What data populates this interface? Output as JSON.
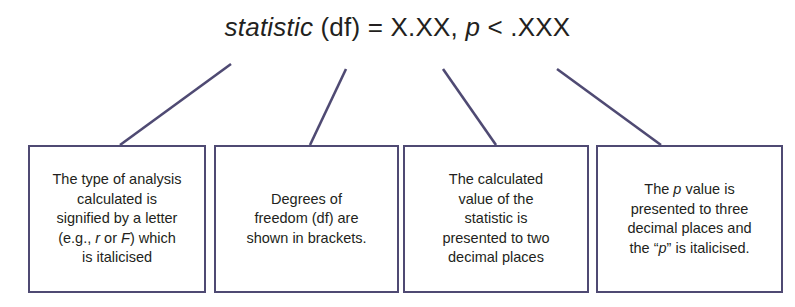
{
  "figure": {
    "kind": "annotated-formula-diagram",
    "border_color": "#4f4a73",
    "line_color": "#4f4a73",
    "text_color": "#231f20",
    "background": "#ffffff"
  },
  "formula": {
    "statistic": "statistic",
    "df": " (df) = ",
    "value": "X.XX, ",
    "p": "p",
    "pvalue": " < .XXX"
  },
  "boxes": [
    {
      "id": "box-1",
      "name": "statistic-letter-explanation",
      "line1": "The type of analysis",
      "line2": "calculated is",
      "line3": "signified by a letter",
      "line4_pre": "(e.g., ",
      "line4_r": "r",
      "line4_mid": " or ",
      "line4_f": "F",
      "line4_post": ") which",
      "line5": "is italicised"
    },
    {
      "id": "box-2",
      "name": "degrees-of-freedom-explanation",
      "line1": "Degrees of",
      "line2": "freedom (df) are",
      "line3": "shown in brackets."
    },
    {
      "id": "box-3",
      "name": "calculated-value-explanation",
      "line1": "The calculated",
      "line2": "value of the",
      "line3": "statistic is",
      "line4": "presented to two",
      "line5": "decimal places"
    },
    {
      "id": "box-4",
      "name": "p-value-explanation",
      "line1_pre": "The ",
      "line1_p": "p",
      "line1_post": " value is",
      "line2": "presented to three",
      "line3": "decimal places and",
      "line4_pre": "the “",
      "line4_p": "p",
      "line4_post": "” is italicised."
    }
  ],
  "connectors": [
    {
      "name": "connector-statistic",
      "x1": 120,
      "y1": 145,
      "x2": 231,
      "y2": 64
    },
    {
      "name": "connector-df",
      "x1": 310,
      "y1": 145,
      "x2": 346,
      "y2": 69
    },
    {
      "name": "connector-value",
      "x1": 496,
      "y1": 145,
      "x2": 443,
      "y2": 69
    },
    {
      "name": "connector-pvalue",
      "x1": 661,
      "y1": 145,
      "x2": 557,
      "y2": 69
    }
  ]
}
